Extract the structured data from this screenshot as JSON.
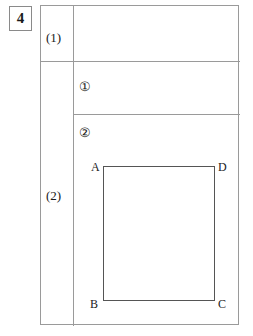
{
  "worksheet": {
    "problem_number": "4",
    "table": {
      "rows": [
        {
          "label": "(1)",
          "answer_value": ""
        },
        {
          "label": "(2)",
          "sub_rows": [
            {
              "marker": "①",
              "answer_value": ""
            },
            {
              "marker": "②",
              "answer_value": ""
            }
          ]
        }
      ]
    },
    "figure": {
      "shape_name": "rectangle-abcd",
      "vertices": [
        {
          "name": "A",
          "position": "top-left"
        },
        {
          "name": "D",
          "position": "top-right"
        },
        {
          "name": "B",
          "position": "bottom-left"
        },
        {
          "name": "C",
          "position": "bottom-right"
        }
      ]
    },
    "colors": {
      "rule": "#9a9a9a",
      "figure_stroke": "#555555",
      "text": "#1a1a1a",
      "background": "#ffffff"
    }
  }
}
